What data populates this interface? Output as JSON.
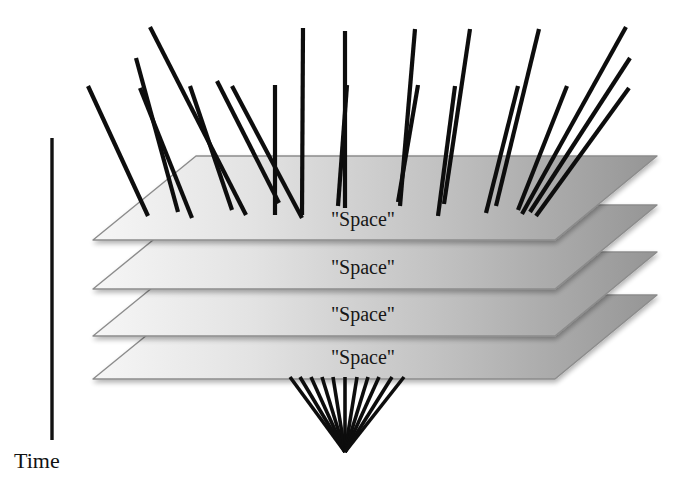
{
  "figure": {
    "background_color": "#ffffff",
    "title": "",
    "axis": {
      "caption": "Time",
      "caption_x": 14,
      "caption_y": 468,
      "line_color": "#111111",
      "line_width": 3.4,
      "x": 52,
      "y_top": 138,
      "y_bottom": 440
    },
    "planes": {
      "count": 4,
      "label": "\"Space\"",
      "label_x": 363,
      "label_font_size": 20,
      "edge_color": "#8c8c8c",
      "edge_width": 1.4,
      "fill_left_color": "#f2f2f2",
      "fill_mid_color": "#d2d2d2",
      "fill_right_color": "#9a9a9a",
      "items": [
        {
          "index": 1,
          "label": "\"Space\"",
          "label_y": 226,
          "left_vertex_x": 93,
          "left_vertex_y": 240,
          "back_left_x": 196,
          "back_left_y": 156,
          "back_right_x": 657,
          "back_right_y": 156,
          "front_right_x": 555,
          "front_right_y": 240
        },
        {
          "index": 2,
          "label": "\"Space\"",
          "label_y": 274,
          "left_vertex_x": 93,
          "left_vertex_y": 289,
          "back_left_x": 196,
          "back_left_y": 205,
          "back_right_x": 657,
          "back_right_y": 205,
          "front_right_x": 555,
          "front_right_y": 289
        },
        {
          "index": 3,
          "label": "\"Space\"",
          "label_y": 321,
          "left_vertex_x": 93,
          "left_vertex_y": 336,
          "back_left_x": 196,
          "back_left_y": 252,
          "back_right_x": 657,
          "back_right_y": 252,
          "front_right_x": 555,
          "front_right_y": 336
        },
        {
          "index": 4,
          "label": "\"Space\"",
          "label_y": 364,
          "left_vertex_x": 93,
          "left_vertex_y": 379,
          "back_left_x": 196,
          "back_left_y": 295,
          "back_right_x": 657,
          "back_right_y": 295,
          "front_right_x": 555,
          "front_right_y": 379
        }
      ]
    },
    "upper_rays": {
      "description": "Diverging world-lines emerging upward from the top plane",
      "color": "#0d0d0d",
      "width": 4.2,
      "count": 21,
      "segments": [
        {
          "x1": 148,
          "y1": 216,
          "x2": 88,
          "y2": 86
        },
        {
          "x1": 178,
          "y1": 212,
          "x2": 136,
          "y2": 58
        },
        {
          "x1": 192,
          "y1": 218,
          "x2": 140,
          "y2": 88
        },
        {
          "x1": 246,
          "y1": 215,
          "x2": 150,
          "y2": 27
        },
        {
          "x1": 232,
          "y1": 210,
          "x2": 190,
          "y2": 86
        },
        {
          "x1": 279,
          "y1": 203,
          "x2": 217,
          "y2": 81
        },
        {
          "x1": 302,
          "y1": 218,
          "x2": 232,
          "y2": 86
        },
        {
          "x1": 275,
          "y1": 215,
          "x2": 275,
          "y2": 85
        },
        {
          "x1": 302,
          "y1": 215,
          "x2": 303,
          "y2": 28
        },
        {
          "x1": 338,
          "y1": 206,
          "x2": 347,
          "y2": 85
        },
        {
          "x1": 345,
          "y1": 208,
          "x2": 345,
          "y2": 31
        },
        {
          "x1": 398,
          "y1": 202,
          "x2": 418,
          "y2": 85
        },
        {
          "x1": 400,
          "y1": 206,
          "x2": 415,
          "y2": 29
        },
        {
          "x1": 438,
          "y1": 216,
          "x2": 455,
          "y2": 86
        },
        {
          "x1": 444,
          "y1": 204,
          "x2": 470,
          "y2": 29
        },
        {
          "x1": 486,
          "y1": 213,
          "x2": 518,
          "y2": 86
        },
        {
          "x1": 496,
          "y1": 206,
          "x2": 539,
          "y2": 29
        },
        {
          "x1": 518,
          "y1": 210,
          "x2": 567,
          "y2": 86
        },
        {
          "x1": 522,
          "y1": 214,
          "x2": 626,
          "y2": 27
        },
        {
          "x1": 530,
          "y1": 212,
          "x2": 630,
          "y2": 58
        },
        {
          "x1": 536,
          "y1": 216,
          "x2": 629,
          "y2": 88
        }
      ]
    },
    "lower_cone": {
      "description": "Converging world-lines meeting at a single point below the bottom plane",
      "color": "#0d0d0d",
      "width": 3.6,
      "apex_x": 345,
      "apex_y": 452,
      "count": 11,
      "fan_top_y": 377,
      "fan_top_x_values": [
        290,
        300,
        311,
        322,
        333,
        345,
        357,
        368,
        379,
        392,
        404
      ]
    }
  }
}
